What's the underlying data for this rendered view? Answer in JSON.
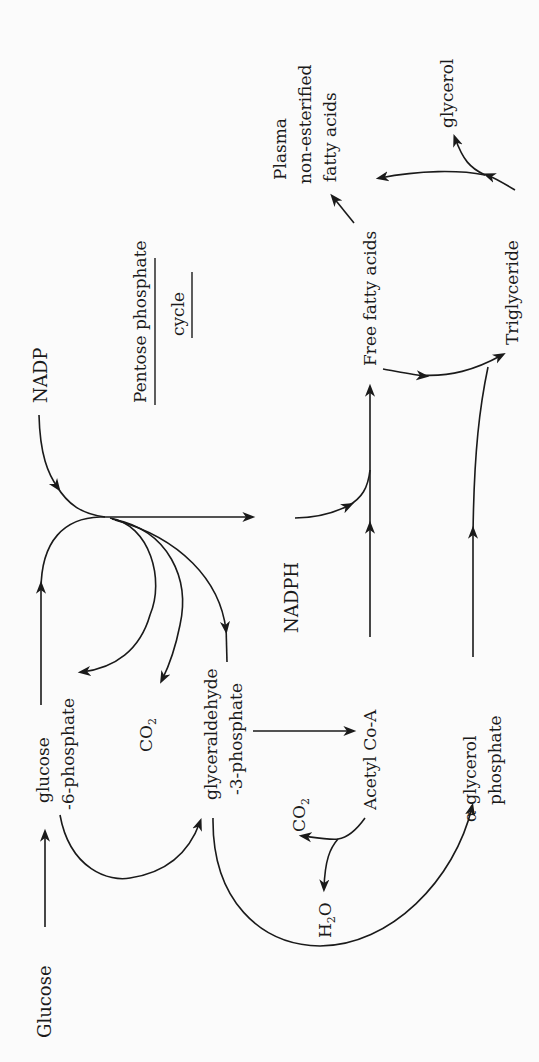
{
  "diagram": {
    "orientation": "rotated 90 degrees counterclockwise",
    "cycle_label": {
      "line1": "Pentose phosphate",
      "line2": "cycle"
    },
    "nodes": {
      "glucose": "Glucose",
      "g6p_line1": "glucose",
      "g6p_line2": "-6-phosphate",
      "nadp": "NADP",
      "nadph": "NADPH",
      "co2_pentose": "CO",
      "co2_pentose_sub": "2",
      "gap_line1": "glyceraldehyde",
      "gap_line2": "-3-phosphate",
      "acetyl_coa": "Acetyl Co-A",
      "co2_acetyl": "CO",
      "co2_acetyl_sub": "2",
      "h2o_h": "H",
      "h2o_sub": "2",
      "h2o_o": "O",
      "agp_line1": "α-glycerol",
      "agp_line2": "phosphate",
      "ffa": "Free fatty acids",
      "plasma_line1": "Plasma",
      "plasma_line2": "non-esterified",
      "plasma_line3": "fatty acids",
      "triglyceride": "Triglyceride",
      "glycerol": "glycerol"
    },
    "edges": [
      {
        "from": "Glucose",
        "to": "glucose-6-phosphate"
      },
      {
        "from": "glucose-6-phosphate",
        "to": "Pentose phosphate cycle"
      },
      {
        "from": "NADP",
        "to": "Pentose phosphate cycle"
      },
      {
        "from": "Pentose phosphate cycle",
        "to": "NADPH"
      },
      {
        "from": "Pentose phosphate cycle",
        "to": "glucose-6-phosphate"
      },
      {
        "from": "Pentose phosphate cycle",
        "to": "CO2"
      },
      {
        "from": "Pentose phosphate cycle",
        "to": "glyceraldehyde-3-phosphate"
      },
      {
        "from": "glucose-6-phosphate",
        "to": "glyceraldehyde-3-phosphate"
      },
      {
        "from": "glyceraldehyde-3-phosphate",
        "to": "Acetyl Co-A"
      },
      {
        "from": "glyceraldehyde-3-phosphate",
        "to": "α-glycerol phosphate"
      },
      {
        "from": "Acetyl Co-A",
        "to": "CO2"
      },
      {
        "from": "Acetyl Co-A",
        "to": "H2O"
      },
      {
        "from": "Acetyl Co-A",
        "to": "Free fatty acids"
      },
      {
        "from": "NADPH",
        "to": "Free fatty acids"
      },
      {
        "from": "Free fatty acids",
        "to": "Triglyceride"
      },
      {
        "from": "α-glycerol phosphate",
        "to": "Triglyceride"
      },
      {
        "from": "Free fatty acids",
        "to": "Plasma non-esterified fatty acids"
      },
      {
        "from": "Triglyceride",
        "to": "Free fatty acids"
      },
      {
        "from": "Triglyceride",
        "to": "glycerol"
      }
    ],
    "colors": {
      "ink": "#1a1a1a",
      "background": "#fbfbfb"
    }
  }
}
